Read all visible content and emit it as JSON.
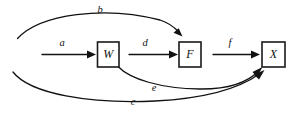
{
  "diagram": {
    "type": "path-diagram",
    "title": "",
    "background_color": "#ffffff",
    "stroke_color": "#111111",
    "node_fill_color": "#ffffff",
    "nodes": [
      {
        "id": "W",
        "label": "W",
        "x": 108,
        "y": 54.5
      },
      {
        "id": "F",
        "label": "F",
        "x": 190,
        "y": 54.5
      },
      {
        "id": "X",
        "label": "X",
        "x": 273.5,
        "y": 54.5
      }
    ],
    "edges": [
      {
        "id": "a",
        "label": "a",
        "from": "",
        "to": "W",
        "shape": "straight",
        "label_x": 62,
        "label_y": 44
      },
      {
        "id": "b",
        "label": "b",
        "from": "",
        "to": "F",
        "shape": "curve-above",
        "label_x": 100,
        "label_y": 11
      },
      {
        "id": "c",
        "label": "c",
        "from": "",
        "to": "X",
        "shape": "curve-below",
        "label_x": 133,
        "label_y": 103
      },
      {
        "id": "d",
        "label": "d",
        "from": "W",
        "to": "F",
        "shape": "straight",
        "label_x": 145,
        "label_y": 43
      },
      {
        "id": "e",
        "label": "e",
        "from": "W",
        "to": "X",
        "shape": "curve-below",
        "label_x": 154,
        "label_y": 89
      },
      {
        "id": "f",
        "label": "f",
        "from": "F",
        "to": "X",
        "shape": "straight",
        "label_x": 230,
        "label_y": 43
      }
    ]
  }
}
